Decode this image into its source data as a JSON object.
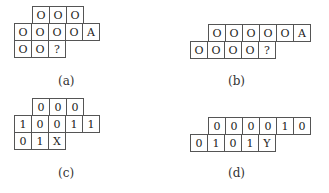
{
  "panels": [
    {
      "caption": "(a)",
      "rows": [
        [
          "O",
          "O",
          "O"
        ],
        [
          "O",
          "O",
          "O",
          "O",
          "A"
        ],
        [
          "O",
          "O",
          "?"
        ]
      ]
    },
    {
      "caption": "(b)",
      "rows": [
        [
          "O",
          "O",
          "O",
          "O",
          "O",
          "A"
        ],
        [
          "O",
          "O",
          "O",
          "O",
          "?"
        ]
      ]
    },
    {
      "caption": "(c)",
      "rows": [
        [
          "0",
          "0",
          "0"
        ],
        [
          "1",
          "0",
          "0",
          "1",
          "1"
        ],
        [
          "0",
          "1",
          "X"
        ]
      ]
    },
    {
      "caption": "(d)",
      "rows": [
        [
          "0",
          "0",
          "0",
          "0",
          "1",
          "0"
        ],
        [
          "0",
          "1",
          "0",
          "1",
          "Y"
        ]
      ]
    }
  ]
}
